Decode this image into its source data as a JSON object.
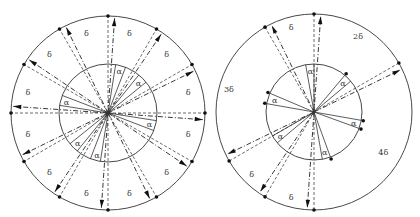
{
  "figure": {
    "left_diagram": {
      "center": [
        108,
        113
      ],
      "outer_radius": 97,
      "inner_radius": 49,
      "ray_angles_deg": [
        90,
        60,
        30,
        0,
        -30,
        -60,
        -90,
        -120,
        -150,
        180,
        150,
        120
      ],
      "alpha_offset_deg": 10,
      "alpha_label_angles_deg": [
        75,
        45,
        165,
        -15,
        -105,
        -135
      ],
      "delta_label_angles_deg": [
        105,
        75,
        45,
        15,
        -15,
        -45,
        -75,
        -105,
        -135,
        -165,
        165,
        135
      ],
      "labels": {
        "alpha": "α",
        "delta": "δ"
      }
    },
    "right_diagram": {
      "center": [
        314,
        112
      ],
      "outer_radius": 98,
      "inner_radius": 48,
      "outer_ray_angles_deg": [
        90,
        120,
        30,
        -150,
        -120,
        -90
      ],
      "alpha_offset_deg": 10,
      "inner_pairs": [
        {
          "a": 50,
          "b": 40,
          "label_angle": 45
        },
        {
          "a": 157,
          "b": 170,
          "label_angle": 163
        },
        {
          "a": -10,
          "b": -20,
          "label_angle": -15
        },
        {
          "a": -70,
          "b": -80,
          "label_angle": -75
        },
        {
          "a": 100,
          "b": 90,
          "label_angle": 95
        },
        {
          "a": -140,
          "b": -150,
          "label_angle": -145
        }
      ],
      "inner_dot_angles_deg": [
        50,
        157,
        170,
        -10,
        -20,
        -70
      ],
      "region_labels": [
        {
          "text": "δ",
          "angle": 105,
          "r": 88
        },
        {
          "text": "2δ",
          "angle": 60,
          "r": 88
        },
        {
          "text": "3δ",
          "angle": 165,
          "r": 88
        },
        {
          "text": "4δ",
          "angle": -30,
          "r": 80
        },
        {
          "text": "δ",
          "angle": -135,
          "r": 88
        },
        {
          "text": "δ",
          "angle": -105,
          "r": 88
        }
      ],
      "labels": {
        "alpha": "α"
      }
    }
  }
}
